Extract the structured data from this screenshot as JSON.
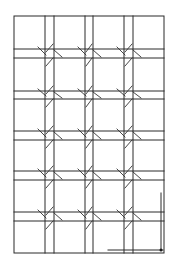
{
  "diagram": {
    "type": "structural-grid-drawing",
    "stroke_color": "#2a2a2a",
    "background": "#ffffff",
    "frame": {
      "x1": 14,
      "y1": 16,
      "x2": 164,
      "y2": 253
    },
    "vertical_pairs": [
      [
        45,
        54
      ],
      [
        85,
        93
      ],
      [
        124,
        133
      ]
    ],
    "horizontal_pairs": [
      [
        49,
        58
      ],
      [
        91,
        99
      ],
      [
        131,
        140
      ],
      [
        171,
        180
      ],
      [
        212,
        221
      ]
    ],
    "corner_detail": {
      "vertical": {
        "x": 161,
        "y1": 193,
        "y2": 250
      },
      "horizontal": {
        "y": 250,
        "x1": 108,
        "x2": 163
      },
      "dot": {
        "x": 161,
        "y": 250
      }
    }
  }
}
